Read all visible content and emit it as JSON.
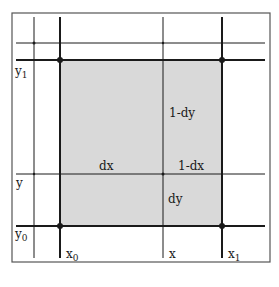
{
  "diagram": {
    "type": "bilinear-interpolation-cell",
    "colors": {
      "line": "#1a1a1a",
      "frame": "#555555",
      "shade": "#d9d9d9",
      "background": "#ffffff"
    },
    "axis_labels": {
      "x0": {
        "base": "x",
        "sub": "0"
      },
      "x": {
        "base": "x",
        "sub": ""
      },
      "x1": {
        "base": "x",
        "sub": "1"
      },
      "y1": {
        "base": "y",
        "sub": "1"
      },
      "y": {
        "base": "y",
        "sub": ""
      },
      "y0": {
        "base": "y",
        "sub": "0"
      }
    },
    "annotations": {
      "one_minus_dy": "1-dy",
      "dx": "dx",
      "one_minus_dx": "1-dx",
      "dy": "dy"
    }
  }
}
